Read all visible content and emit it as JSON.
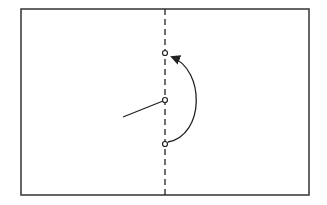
{
  "diagram": {
    "frame": {
      "x": 21,
      "y": 9,
      "width": 288,
      "height": 186,
      "stroke": "#333333"
    },
    "axis": {
      "x": 165,
      "y1": 9,
      "y2": 195,
      "stroke": "#222222",
      "dash": "6,4"
    },
    "points": [
      {
        "name": "top",
        "x": 165,
        "y": 53
      },
      {
        "name": "middle",
        "x": 165,
        "y": 100
      },
      {
        "name": "bottom",
        "x": 165,
        "y": 144
      }
    ],
    "segment": {
      "x1": 123,
      "y1": 117,
      "x2": 165,
      "y2": 100
    },
    "arc": {
      "path": "M 167 143 C 210 135, 205 65, 172 57",
      "arrow_target": {
        "x": 168,
        "y": 54
      }
    },
    "colors": {
      "line": "#222222",
      "background": "#ffffff"
    }
  }
}
